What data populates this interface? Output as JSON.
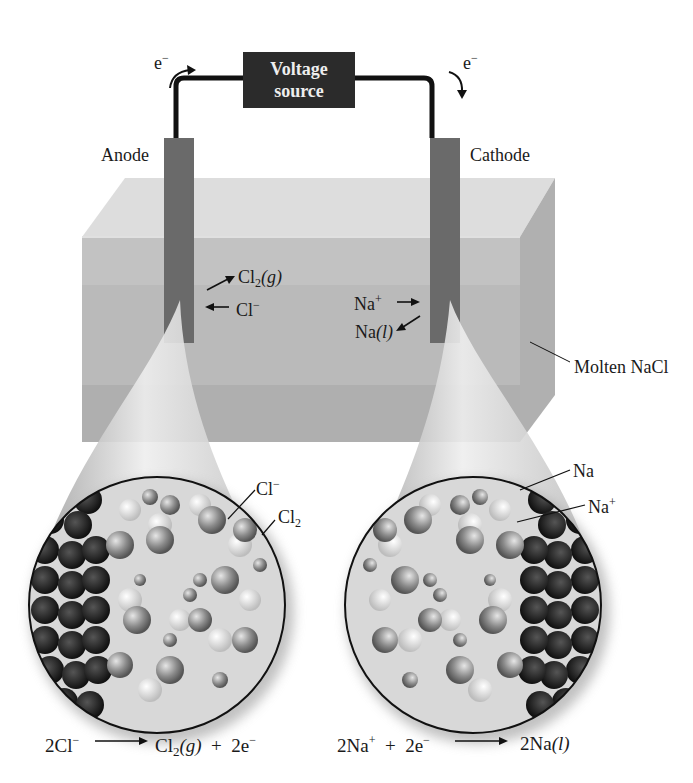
{
  "diagram": {
    "voltage_source": {
      "line1": "Voltage",
      "line2": "source"
    },
    "electron_left": {
      "base": "e",
      "sup": "−"
    },
    "electron_right": {
      "base": "e",
      "sup": "−"
    },
    "anode_label": "Anode",
    "cathode_label": "Cathode",
    "electrolyte_label": "Molten NaCl",
    "anode_products": {
      "cl2": {
        "base": "Cl",
        "sub": "2",
        "state": "(g)"
      },
      "cl_ion": {
        "base": "Cl",
        "sup": "−"
      }
    },
    "cathode_products": {
      "na_ion": {
        "base": "Na",
        "sup": "+"
      },
      "na_liquid": {
        "base": "Na",
        "state": "(l)"
      }
    },
    "left_zoom_labels": {
      "cl_ion": {
        "base": "Cl",
        "sup": "−"
      },
      "cl2": {
        "base": "Cl",
        "sub": "2"
      }
    },
    "right_zoom_labels": {
      "na": {
        "base": "Na"
      },
      "na_ion": {
        "base": "Na",
        "sup": "+"
      }
    },
    "equations": {
      "anode": {
        "lhs_coef": "2",
        "lhs": "Cl",
        "lhs_sup": "−",
        "rhs1": "Cl",
        "rhs1_sub": "2",
        "rhs1_state": "(g)",
        "plus": "+",
        "rhs2": "2e",
        "rhs2_sup": "−"
      },
      "cathode": {
        "lhs1": "2Na",
        "lhs1_sup": "+",
        "plus": "+",
        "lhs2": "2e",
        "lhs2_sup": "−",
        "rhs": "2Na",
        "rhs_state": "(l)"
      }
    }
  }
}
